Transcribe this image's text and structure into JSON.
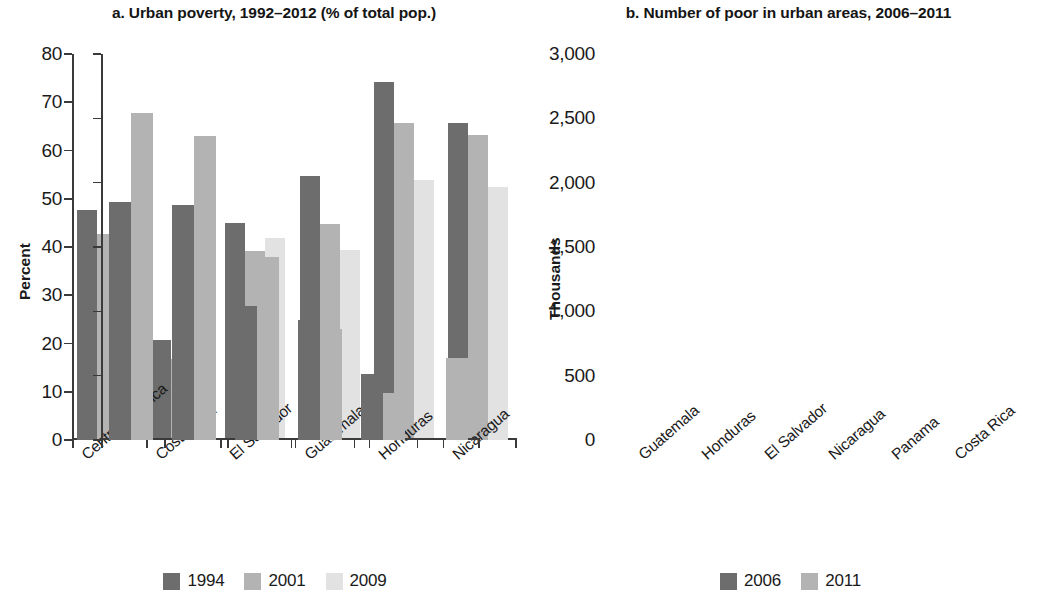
{
  "chart_data": [
    {
      "type": "bar",
      "panel": "a",
      "title": "a. Urban poverty, 1992–2012 (% of total pop.)",
      "xlabel": "",
      "ylabel": "Percent",
      "ylim": [
        0,
        80
      ],
      "yticks": [
        0,
        10,
        20,
        30,
        40,
        50,
        60,
        70,
        80
      ],
      "ytick_labels": [
        "0",
        "10",
        "20",
        "30",
        "40",
        "50",
        "60",
        "70",
        "80"
      ],
      "grid": false,
      "legend_position": "bottom",
      "categories": [
        "Central America",
        "Costa Rica",
        "El Salvador",
        "Guatemala",
        "Honduras",
        "Nicaragua"
      ],
      "series": [
        {
          "name": "1994",
          "color": "#6d6d6d",
          "values": [
            47.6,
            20.7,
            44.9,
            54.7,
            74.3,
            65.6
          ]
        },
        {
          "name": "2001",
          "color": "#b3b3b3",
          "values": [
            42.8,
            16.8,
            39.2,
            44.7,
            65.6,
            63.2
          ]
        },
        {
          "name": "2009",
          "color": "#e2e2e2",
          "values": [
            37.3,
            17.9,
            41.8,
            39.4,
            53.8,
            52.5
          ]
        }
      ]
    },
    {
      "type": "bar",
      "panel": "b",
      "title": "b. Number of poor in urban areas, 2006–2011",
      "xlabel": "",
      "ylabel": "Thousands",
      "ylim": [
        0,
        3000
      ],
      "yticks": [
        0,
        500,
        1000,
        1500,
        2000,
        2500,
        3000
      ],
      "ytick_labels": [
        "0",
        "500",
        "1,000",
        "1,500",
        "2,000",
        "2,500",
        "3,000"
      ],
      "grid": false,
      "legend_position": "bottom",
      "categories": [
        "Guatemala",
        "Honduras",
        "El Salvador",
        "Nicaragua",
        "Panama",
        "Costa Rica"
      ],
      "series": [
        {
          "name": "2006",
          "color": "#6d6d6d",
          "values": [
            1850,
            1825,
            1040,
            930,
            510,
            null
          ]
        },
        {
          "name": "2011",
          "color": "#b3b3b3",
          "values": [
            2545,
            2365,
            1425,
            865,
            365,
            640
          ]
        }
      ]
    }
  ],
  "panels": {
    "a": {
      "title": "a. Urban poverty, 1992–2012 (% of total pop.)",
      "axis_title": "Percent",
      "ytick_labels": [
        "80",
        "70",
        "60",
        "50",
        "40",
        "30",
        "20",
        "10",
        "0"
      ],
      "categories": [
        "Central America",
        "Costa Rica",
        "El Salvador",
        "Guatemala",
        "Honduras",
        "Nicaragua"
      ],
      "legend": [
        {
          "label": "1994",
          "color": "#6d6d6d"
        },
        {
          "label": "2001",
          "color": "#b3b3b3"
        },
        {
          "label": "2009",
          "color": "#e2e2e2"
        }
      ]
    },
    "b": {
      "title": "b. Number of poor in urban areas, 2006–2011",
      "axis_title": "Thousands",
      "ytick_labels": [
        "3,000",
        "2,500",
        "2,000",
        "1,500",
        "1,000",
        "500",
        "0"
      ],
      "categories": [
        "Guatemala",
        "Honduras",
        "El Salvador",
        "Nicaragua",
        "Panama",
        "Costa Rica"
      ],
      "legend": [
        {
          "label": "2006",
          "color": "#6d6d6d"
        },
        {
          "label": "2011",
          "color": "#b3b3b3"
        }
      ]
    }
  }
}
